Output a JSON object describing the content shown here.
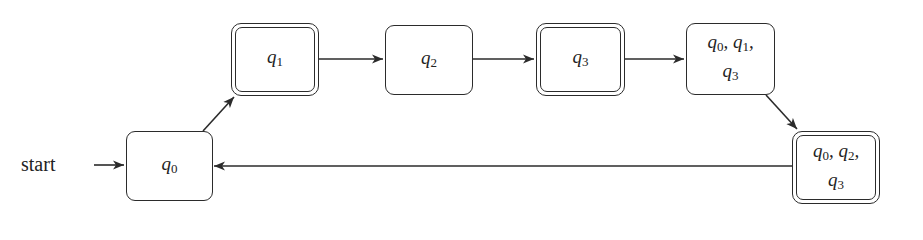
{
  "diagram": {
    "type": "finite-automaton",
    "start_label": "start",
    "states": [
      {
        "id": "q0",
        "label_lines": [
          "q0"
        ],
        "accepting": false,
        "start": true
      },
      {
        "id": "q1",
        "label_lines": [
          "q1"
        ],
        "accepting": true,
        "start": false
      },
      {
        "id": "q2",
        "label_lines": [
          "q2"
        ],
        "accepting": false,
        "start": false
      },
      {
        "id": "q3",
        "label_lines": [
          "q3"
        ],
        "accepting": true,
        "start": false
      },
      {
        "id": "q0q1q3",
        "label_lines": [
          "q0, q1,",
          "q3"
        ],
        "accepting": false,
        "start": false
      },
      {
        "id": "q0q2q3",
        "label_lines": [
          "q0, q2,",
          "q3"
        ],
        "accepting": true,
        "start": false
      }
    ],
    "transitions": [
      {
        "from": "start",
        "to": "q0",
        "label": ""
      },
      {
        "from": "q0",
        "to": "q1",
        "label": ""
      },
      {
        "from": "q1",
        "to": "q2",
        "label": ""
      },
      {
        "from": "q2",
        "to": "q3",
        "label": ""
      },
      {
        "from": "q3",
        "to": "q0q1q3",
        "label": ""
      },
      {
        "from": "q0q1q3",
        "to": "q0q2q3",
        "label": ""
      },
      {
        "from": "q0q2q3",
        "to": "q0",
        "label": ""
      }
    ],
    "colors": {
      "stroke": "#2b2b2b",
      "background": "#ffffff",
      "text": "#222222"
    }
  }
}
